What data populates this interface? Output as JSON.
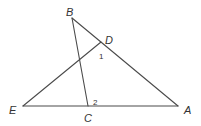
{
  "diagram": {
    "type": "geometry",
    "points": {
      "B": {
        "label": "B",
        "x": 72,
        "y": 18
      },
      "D": {
        "label": "D",
        "x": 101,
        "y": 42
      },
      "E": {
        "label": "E",
        "x": 23,
        "y": 106
      },
      "C": {
        "label": "C",
        "x": 88,
        "y": 106
      },
      "A": {
        "label": "A",
        "x": 178,
        "y": 106
      }
    },
    "segments": [
      {
        "from": "B",
        "to": "A"
      },
      {
        "from": "E",
        "to": "D"
      },
      {
        "from": "B",
        "to": "C"
      },
      {
        "from": "E",
        "to": "A"
      }
    ],
    "angle_labels": {
      "angle1": {
        "label": "1",
        "at": "D"
      },
      "angle2": {
        "label": "2",
        "at": "C"
      }
    }
  }
}
